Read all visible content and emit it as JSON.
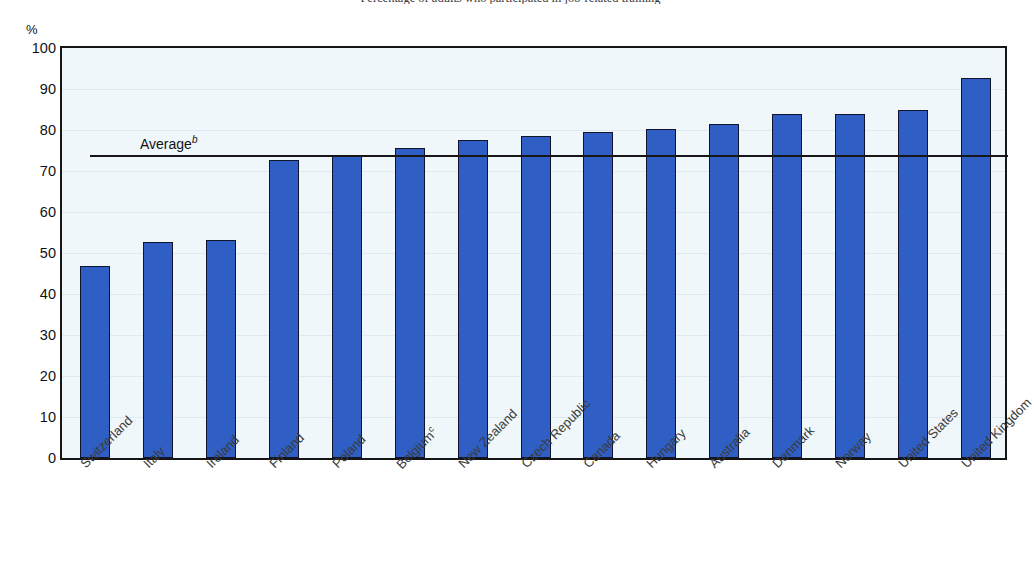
{
  "chart_data": {
    "type": "bar",
    "title": "Percentage of adults who participated in job-related training",
    "ylabel": "%",
    "xlabel": "",
    "unit_label": "%",
    "ylim": [
      0,
      100
    ],
    "yticks": [
      0,
      10,
      20,
      30,
      40,
      50,
      60,
      70,
      80,
      90,
      100
    ],
    "grid": true,
    "legend": "none",
    "categories": [
      "Switzerland",
      "Italy",
      "Ireland",
      "Finland",
      "Poland",
      "Belgium",
      "New Zealand",
      "Czech Republic",
      "Canada",
      "Hungary",
      "Australia",
      "Denmark",
      "Norway",
      "United States",
      "United Kingdom"
    ],
    "category_footnotes": [
      "",
      "",
      "",
      "",
      "",
      "c",
      "",
      "",
      "",
      "",
      "",
      "",
      "",
      "",
      ""
    ],
    "values": [
      46.8,
      52.7,
      53.2,
      72.7,
      73.9,
      75.6,
      77.6,
      78.6,
      79.4,
      80.2,
      81.4,
      83.8,
      83.9,
      84.9,
      92.7
    ],
    "annotations": [
      {
        "name": "average-line",
        "label": "Average",
        "footnote": "b",
        "value": 74.0,
        "style": "horizontal-reference-line"
      }
    ],
    "colors": {
      "bar": "#2f5fc4",
      "bar_outline": "#12132b",
      "plot_background": "#eff7fa",
      "axis": "#161616",
      "text": "#111111",
      "gridline": "#dfeaf0"
    }
  }
}
